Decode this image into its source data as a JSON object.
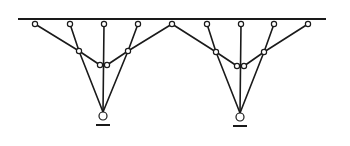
{
  "diagram": {
    "type": "tree-support structure",
    "colors": {
      "stroke": "#1a1a1a",
      "background": "#ffffff",
      "joint_fill": "#ffffff"
    },
    "beam": {
      "x1": 18,
      "x2": 326,
      "y": 19
    },
    "top_joints_y": 24,
    "top_joints_x": [
      35,
      70,
      104,
      138,
      172,
      207,
      241,
      274,
      308
    ],
    "shared_apex_joint_x": 172,
    "trees": [
      {
        "id": "left",
        "mid_joints": [
          [
            79,
            51
          ],
          [
            128,
            51
          ]
        ],
        "bottom_joints": [
          [
            100,
            65
          ],
          [
            107,
            65
          ]
        ],
        "support": [
          103,
          116
        ],
        "ground": {
          "x1": 96,
          "x2": 110,
          "y": 125
        },
        "top_left_x": [
          35,
          70
        ],
        "center_x": 104,
        "top_right_x": [
          138,
          172
        ]
      },
      {
        "id": "right",
        "mid_joints": [
          [
            216,
            52
          ],
          [
            264,
            52
          ]
        ],
        "bottom_joints": [
          [
            237,
            66
          ],
          [
            244,
            66
          ]
        ],
        "support": [
          240,
          117
        ],
        "ground": {
          "x1": 233,
          "x2": 247,
          "y": 126
        },
        "top_left_x": [
          172,
          207
        ],
        "center_x": 241,
        "top_right_x": [
          274,
          308
        ]
      }
    ]
  }
}
